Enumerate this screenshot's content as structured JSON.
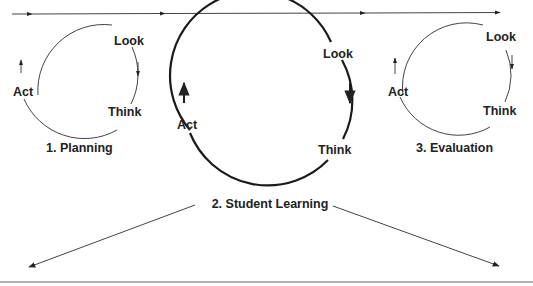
{
  "diagram": {
    "colors": {
      "ink": "#222222",
      "thin_stroke": "#444444",
      "baseline": "#9a9a9a",
      "background": "#ffffff"
    },
    "timeline": {
      "direction": "left-to-right",
      "arrowheads": 4
    },
    "cycles": [
      {
        "id": "planning",
        "title": "1. Planning",
        "emphasis": "thin",
        "nodes": {
          "look": "Look",
          "think": "Think",
          "act": "Act"
        }
      },
      {
        "id": "student-learning",
        "title": "2. Student Learning",
        "emphasis": "thick",
        "nodes": {
          "look": "Look",
          "think": "Think",
          "act": "Act"
        }
      },
      {
        "id": "evaluation",
        "title": "3. Evaluation",
        "emphasis": "thin",
        "nodes": {
          "look": "Look",
          "think": "Think",
          "act": "Act"
        }
      }
    ],
    "branch_arrows": [
      {
        "from": "student-learning",
        "direction": "down-left"
      },
      {
        "from": "student-learning",
        "direction": "down-right"
      }
    ]
  }
}
